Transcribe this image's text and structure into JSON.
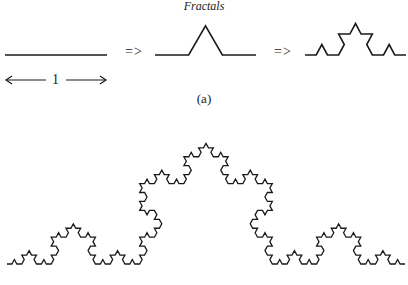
{
  "figure": {
    "title": "Fractals",
    "caption": "(a)",
    "implies_symbol_1": "=>",
    "implies_symbol_2": "=>",
    "unit_label": "1",
    "stroke_color": "#1a1a1a",
    "background": "#ffffff"
  },
  "curves": [
    {
      "name": "koch-iteration-0",
      "level": 0,
      "x0": 5,
      "x1": 107,
      "baseline": 55,
      "vscale": 1.0
    },
    {
      "name": "koch-iteration-1",
      "level": 1,
      "x0": 155,
      "x1": 256,
      "baseline": 55,
      "vscale": 1.0
    },
    {
      "name": "koch-iteration-2",
      "level": 2,
      "x0": 305,
      "x1": 406,
      "baseline": 55,
      "vscale": 1.08
    },
    {
      "name": "koch-curve-large",
      "level": 4,
      "x0": 7,
      "x1": 405,
      "baseline": 264,
      "vscale": 1.05
    }
  ]
}
